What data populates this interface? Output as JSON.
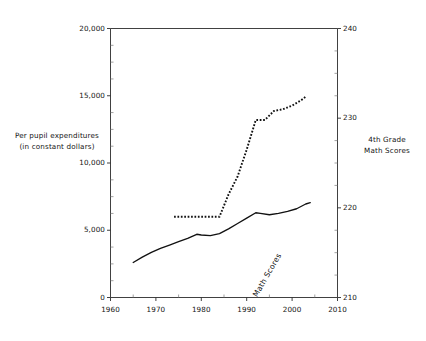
{
  "chart_data": {
    "type": "line",
    "title": "",
    "subtitle": "",
    "xlabel": "",
    "ylabel": "Per pupil expenditures (in constant dollars)",
    "y2label": "4th Grade Math Scores",
    "xlim": [
      1960,
      2010
    ],
    "ylim": [
      0,
      20000
    ],
    "y2lim": [
      210,
      240
    ],
    "grid": false,
    "legend_position": "inline-annotation",
    "x_ticks": [
      1960,
      1970,
      1980,
      1990,
      2000,
      2010
    ],
    "x_tick_labels": [
      "1960",
      "1970",
      "1980",
      "1990",
      "2000",
      "2010"
    ],
    "x_minor_ticks": [
      1965,
      1975,
      1985,
      1995,
      2005
    ],
    "y_ticks": [
      0,
      5000,
      10000,
      15000,
      20000
    ],
    "y_tick_labels": [
      "0",
      "5,000",
      "10,000",
      "15,000",
      "20,000"
    ],
    "y_minor_tick_interval": 1250,
    "y2_ticks": [
      210,
      220,
      230,
      240
    ],
    "y2_tick_labels": [
      "210",
      "220",
      "230",
      "240"
    ],
    "y2_minor_tick_interval": 2.5,
    "series": [
      {
        "name": "Per pupil expenditures",
        "axis": "left",
        "style": "solid",
        "color": "#111111",
        "annotation": "Per pupil expenditures",
        "x": [
          1965,
          1967,
          1969,
          1971,
          1973,
          1975,
          1977,
          1979,
          1980,
          1982,
          1984,
          1986,
          1988,
          1990,
          1992,
          1993,
          1995,
          1997,
          1999,
          2001,
          2003,
          2004
        ],
        "values": [
          2600,
          3000,
          3350,
          3650,
          3900,
          4150,
          4400,
          4700,
          4650,
          4600,
          4750,
          5100,
          5500,
          5900,
          6300,
          6250,
          6150,
          6250,
          6400,
          6600,
          6950,
          7050
        ]
      },
      {
        "name": "Math Scores",
        "axis": "right",
        "style": "dotted",
        "color": "#111111",
        "annotation": "Math Scores",
        "x": [
          1974,
          1978,
          1982,
          1984,
          1986,
          1988,
          1990,
          1992,
          1994,
          1996,
          1998,
          2000,
          2002,
          2003
        ],
        "values": [
          219,
          219,
          219,
          219,
          221.5,
          223.5,
          226.5,
          229.8,
          229.8,
          230.8,
          231.0,
          231.4,
          232.0,
          232.4
        ]
      }
    ],
    "annotations": [
      {
        "text": "Math Scores",
        "x": 1991,
        "y": 226,
        "rotation": -60
      },
      {
        "text": "Per pupil expenditures",
        "x": 1985,
        "y": 3700,
        "rotation": -12
      }
    ]
  },
  "axis_titles": {
    "left_line1": "Per pupil expenditures",
    "left_line2": "(in constant dollars)",
    "right_line1": "4th Grade",
    "right_line2": "Math Scores"
  }
}
